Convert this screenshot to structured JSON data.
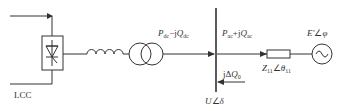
{
  "diagram": {
    "type": "circuit-schematic",
    "labels": {
      "converter": "LCC",
      "dc_power_P": "P",
      "dc_power_P_sub": "dc",
      "dc_power_sep": "−j",
      "dc_power_Q": "Q",
      "dc_power_Q_sub": "dc",
      "ac_power_P": "P",
      "ac_power_P_sub": "ac",
      "ac_power_sep": "+j",
      "ac_power_Q": "Q",
      "ac_power_Q_sub": "ac",
      "comp_prefix": "jΔ",
      "comp_Q": "Q",
      "comp_sub": "0",
      "bus_voltage_U": "U",
      "bus_voltage_angle": "∠",
      "bus_voltage_delta": "δ",
      "impedance_Z": "Z",
      "impedance_Z_sub": "11",
      "impedance_angle": "∠",
      "impedance_theta": "θ",
      "impedance_theta_sub": "11",
      "source_E": "E'",
      "source_angle": "∠",
      "source_phi": "φ"
    },
    "components": [
      {
        "id": "lcc-converter",
        "symbol": "thyristor-valve"
      },
      {
        "id": "smoothing-inductor",
        "symbol": "inductor"
      },
      {
        "id": "converter-transformer",
        "symbol": "transformer"
      },
      {
        "id": "ac-bus",
        "symbol": "busbar"
      },
      {
        "id": "system-impedance",
        "symbol": "impedance"
      },
      {
        "id": "equivalent-source",
        "symbol": "ac-source"
      }
    ],
    "colors": {
      "line": "#333333",
      "text": "#333333",
      "background": "#ffffff"
    }
  }
}
